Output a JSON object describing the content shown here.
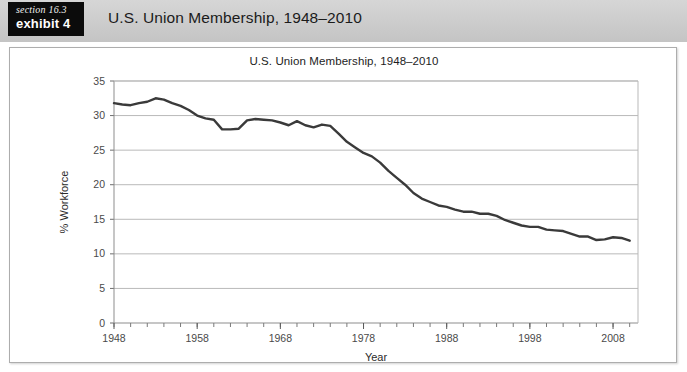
{
  "header": {
    "section_label": "section 16.3",
    "exhibit_label": "exhibit 4",
    "title": "U.S. Union Membership, 1948–2010"
  },
  "chart_data": {
    "type": "line",
    "title": "U.S. Union Membership, 1948–2010",
    "xlabel": "Year",
    "ylabel": "% Workforce",
    "xlim": [
      1948,
      2011
    ],
    "ylim": [
      0,
      35
    ],
    "ytick_step": 5,
    "yticks": [
      0,
      5,
      10,
      15,
      20,
      25,
      30,
      35
    ],
    "xticks": [
      1948,
      1958,
      1968,
      1978,
      1988,
      1998,
      2008
    ],
    "xtick_labels": [
      "1948",
      "1958",
      "1968",
      "1978",
      "1988",
      "1998",
      "2008"
    ],
    "ytick_labels": [
      "0",
      "5",
      "10",
      "15",
      "20",
      "25",
      "30",
      "35"
    ],
    "minor_xtick_interval": 2,
    "grid": "horizontal",
    "legend": null,
    "line_color": "#3a3a3a",
    "line_width": 2.4,
    "series": [
      {
        "name": "% Workforce unionized",
        "x": [
          1948,
          1949,
          1950,
          1951,
          1952,
          1953,
          1954,
          1955,
          1956,
          1957,
          1958,
          1959,
          1960,
          1961,
          1962,
          1963,
          1964,
          1965,
          1966,
          1967,
          1968,
          1969,
          1970,
          1971,
          1972,
          1973,
          1974,
          1975,
          1976,
          1977,
          1978,
          1979,
          1980,
          1981,
          1982,
          1983,
          1984,
          1985,
          1986,
          1987,
          1988,
          1989,
          1990,
          1991,
          1992,
          1993,
          1994,
          1995,
          1996,
          1997,
          1998,
          1999,
          2000,
          2001,
          2002,
          2003,
          2004,
          2005,
          2006,
          2007,
          2008,
          2009,
          2010
        ],
        "values": [
          31.8,
          31.6,
          31.5,
          31.8,
          32.0,
          32.5,
          32.3,
          31.8,
          31.4,
          30.8,
          30.0,
          29.6,
          29.4,
          28.0,
          28.0,
          28.1,
          29.3,
          29.5,
          29.4,
          29.3,
          29.0,
          28.6,
          29.2,
          28.6,
          28.3,
          28.7,
          28.5,
          27.4,
          26.2,
          25.4,
          24.6,
          24.1,
          23.2,
          22.0,
          21.0,
          20.0,
          18.8,
          18.0,
          17.5,
          17.0,
          16.8,
          16.4,
          16.1,
          16.1,
          15.8,
          15.8,
          15.5,
          14.9,
          14.5,
          14.1,
          13.9,
          13.9,
          13.5,
          13.4,
          13.3,
          12.9,
          12.5,
          12.5,
          12.0,
          12.1,
          12.4,
          12.3,
          11.9
        ]
      }
    ]
  }
}
